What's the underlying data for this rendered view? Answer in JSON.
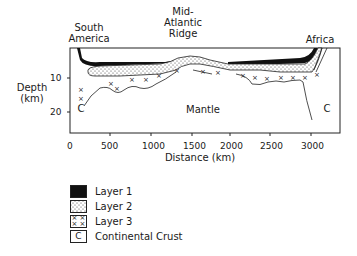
{
  "labels": {
    "south_america": [
      "South",
      "America"
    ],
    "ridge": [
      "Mid-",
      "Atlantic",
      "Ridge"
    ],
    "africa": "Africa",
    "mantle": "Mantle",
    "continental_left": "C",
    "continental_right": "C"
  },
  "axes": {
    "y_label": [
      "Depth",
      "(km)"
    ],
    "y_ticks": [
      "10",
      "20"
    ],
    "x_label": "Distance (km)",
    "x_ticks": [
      "0",
      "500",
      "1000",
      "1500",
      "2000",
      "2500",
      "3000"
    ]
  },
  "legend": [
    {
      "label": "Layer 1",
      "symbol": "solid-black"
    },
    {
      "label": "Layer 2",
      "symbol": "stipple"
    },
    {
      "label": "Layer 3",
      "symbol": "crosses"
    },
    {
      "label": "Continental Crust",
      "symbol": "C"
    }
  ],
  "colors": {
    "ink": "#1a1a1a",
    "background": "#ffffff"
  }
}
